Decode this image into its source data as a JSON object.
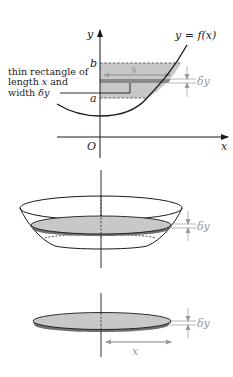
{
  "figure": {
    "top_graph": {
      "y_axis_label": "y",
      "x_axis_label": "x",
      "origin_label": "O",
      "curve_label": "y = f(x)",
      "lower_bound_label": "a",
      "upper_bound_label": "b",
      "strip_length_label": "x",
      "strip_width_label": "δy",
      "annotation": {
        "line1": "thin rectangle of",
        "line2_prefix": "length ",
        "line2_var": "x",
        "line2_suffix": " and",
        "line3_prefix": "width ",
        "line3_var": "δy"
      }
    },
    "bowl_view": {
      "thickness_label": "δy"
    },
    "disc_view": {
      "thickness_label": "δy",
      "radius_label": "x"
    },
    "colors": {
      "line": "#1a1a1a",
      "shade": "#c8c8c8",
      "strip": "#8a8a8a",
      "annotation_gray": "#9a9a9a"
    }
  }
}
